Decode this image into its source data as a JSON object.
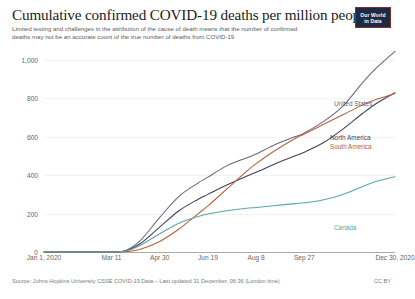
{
  "header": {
    "title": "Cumulative confirmed COVID-19 deaths per million people",
    "subtitle": "Limited testing and challenges in the attribution of the cause of death means that the number of confirmed deaths may not be an accurate count of the true number of deaths from COVID-19",
    "logo_line1": "Our World",
    "logo_line2": "in Data"
  },
  "footer": {
    "source": "Source: Johns Hopkins University CSSE COVID-19 Data – Last updated 31 December, 06:36 (London time)",
    "license": "CC BY"
  },
  "chart_data": {
    "type": "line",
    "title": "Cumulative confirmed COVID-19 deaths per million people",
    "xlabel": "",
    "ylabel": "",
    "ylim": [
      0,
      1000
    ],
    "grid": true,
    "legend_position": "right-inline-end-labels",
    "ytick_labels": [
      "1,000",
      "800",
      "600",
      "400",
      "200",
      "0"
    ],
    "ytick_values": [
      1000,
      800,
      600,
      400,
      200,
      0
    ],
    "xtick_labels": [
      "Jan 1, 2020",
      "Mar 11",
      "Apr 30",
      "Jun 19",
      "Aug 8",
      "Sep 27",
      "Dec 30, 2020"
    ],
    "xtick_values": [
      0,
      70,
      120,
      170,
      220,
      270,
      364
    ],
    "x": [
      0,
      35,
      70,
      85,
      100,
      120,
      140,
      160,
      170,
      190,
      210,
      220,
      240,
      260,
      270,
      290,
      310,
      330,
      345,
      364
    ],
    "series": [
      {
        "name": "United States",
        "color": "#6c6678",
        "values": [
          0,
          0,
          0.2,
          8,
          60,
          180,
          290,
          360,
          390,
          450,
          490,
          510,
          560,
          600,
          620,
          680,
          760,
          880,
          960,
          1045
        ]
      },
      {
        "name": "North America",
        "color": "#3f3f5c",
        "values": [
          0,
          0,
          0.2,
          6,
          44,
          130,
          215,
          275,
          300,
          350,
          395,
          415,
          460,
          500,
          520,
          570,
          640,
          720,
          775,
          830
        ]
      },
      {
        "name": "South America",
        "color": "#b7603c",
        "values": [
          0,
          0,
          0.1,
          2,
          14,
          55,
          120,
          200,
          240,
          330,
          420,
          460,
          530,
          590,
          615,
          665,
          715,
          765,
          795,
          825
        ]
      },
      {
        "name": "Canada",
        "color": "#5aa6a6",
        "values": [
          0,
          0,
          0.2,
          5,
          35,
          95,
          150,
          185,
          198,
          215,
          228,
          232,
          242,
          252,
          256,
          272,
          300,
          340,
          368,
          392
        ]
      }
    ],
    "end_labels": [
      {
        "name": "United States",
        "color": "#6c6678",
        "top": 48,
        "left": 334
      },
      {
        "name": "North America",
        "color": "#3f3f5c",
        "top": 82,
        "left": 330
      },
      {
        "name": "South America",
        "color": "#b7603c",
        "top": 91,
        "left": 330
      },
      {
        "name": "Canada",
        "color": "#5aa6a6",
        "top": 172,
        "left": 334
      }
    ]
  }
}
